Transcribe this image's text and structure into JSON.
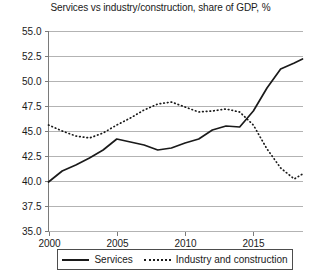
{
  "chart_data": {
    "type": "line",
    "title": "Services vs industry/construction, share of GDP, %",
    "xlabel": "",
    "ylabel": "",
    "xlim": [
      2000,
      2018.6
    ],
    "ylim": [
      35.0,
      55.0
    ],
    "grid": true,
    "legend_position": "bottom",
    "y_ticks": [
      "35.0",
      "37.5",
      "40.0",
      "42.5",
      "45.0",
      "47.5",
      "50.0",
      "52.5",
      "55.0"
    ],
    "y_tick_values": [
      35.0,
      37.5,
      40.0,
      42.5,
      45.0,
      47.5,
      50.0,
      52.5,
      55.0
    ],
    "x_ticks": [
      "2000",
      "2005",
      "2010",
      "2015"
    ],
    "x_tick_values": [
      2000,
      2005,
      2010,
      2015
    ],
    "x": [
      2000,
      2001,
      2002,
      2003,
      2004,
      2005,
      2006,
      2007,
      2008,
      2009,
      2010,
      2011,
      2012,
      2013,
      2014,
      2015,
      2016,
      2017,
      2018
    ],
    "series": [
      {
        "name": "Services",
        "style": "solid",
        "values": [
          39.9,
          41.0,
          41.6,
          42.3,
          43.1,
          44.2,
          43.9,
          43.6,
          43.1,
          43.3,
          43.8,
          44.2,
          45.1,
          45.5,
          45.4,
          47.0,
          49.3,
          51.2,
          51.8
        ]
      },
      {
        "name": "Industry and construction",
        "style": "dotted",
        "values": [
          45.6,
          45.0,
          44.5,
          44.3,
          44.8,
          45.6,
          46.3,
          47.1,
          47.7,
          47.9,
          47.4,
          46.9,
          47.0,
          47.2,
          46.9,
          45.6,
          43.2,
          41.3,
          40.2
        ]
      }
    ],
    "series_endpoints": [
      {
        "name": "Services",
        "x": 2018.6,
        "value": 52.2
      },
      {
        "name": "Industry and construction",
        "x": 2018.6,
        "value": 40.7
      }
    ],
    "colors": {
      "line": "#1a1a1a",
      "grid": "#b3b3b3",
      "axis": "#7a7a7a",
      "background": "#ffffff"
    }
  },
  "legend": {
    "items": [
      {
        "label": "Services",
        "style": "solid"
      },
      {
        "label": "Industry and construction",
        "style": "dotted"
      }
    ]
  }
}
